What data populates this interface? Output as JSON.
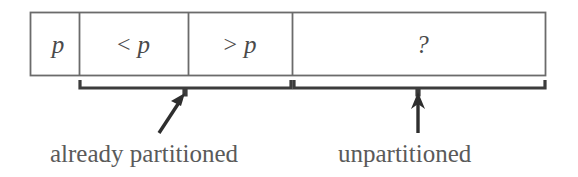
{
  "figure": {
    "colors": {
      "stroke": "#6b6b6b",
      "brace": "#3c3c3c",
      "text": "#565656",
      "background": "#ffffff"
    },
    "array": {
      "name": "partition-array",
      "cells": [
        {
          "id": "pivot",
          "label": "p",
          "operator": "",
          "x": 30,
          "width": 49,
          "role": "pivot element"
        },
        {
          "id": "less-than",
          "label": "p",
          "operator": "<",
          "x": 79,
          "width": 109,
          "role": "elements less than pivot"
        },
        {
          "id": "greater-than",
          "label": "p",
          "operator": ">",
          "x": 188,
          "width": 104,
          "role": "elements greater than pivot"
        },
        {
          "id": "unknown",
          "label": "?",
          "operator": "",
          "x": 292,
          "width": 254,
          "role": "unexamined elements"
        }
      ],
      "top": 12,
      "height": 64
    },
    "braces": [
      {
        "id": "already-partitioned",
        "label": "already partitioned",
        "start_x": 79,
        "end_x": 292,
        "tick_x": 185,
        "arrow": "diagonal"
      },
      {
        "id": "unpartitioned",
        "label": "unpartitioned",
        "start_x": 292,
        "end_x": 546,
        "tick_x": 418,
        "arrow": "vertical"
      }
    ],
    "captions": [
      {
        "id": "caption-already-partitioned",
        "text": "already partitioned",
        "x": 50,
        "y": 141
      },
      {
        "id": "caption-unpartitioned",
        "text": "unpartitioned",
        "x": 338,
        "y": 141
      }
    ]
  }
}
